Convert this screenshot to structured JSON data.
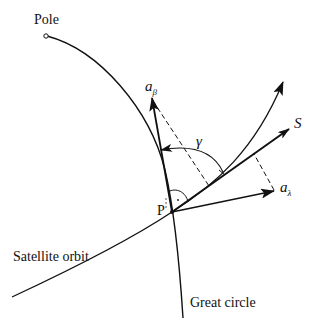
{
  "diagram": {
    "labels": {
      "pole": "Pole",
      "point": "P",
      "a_beta_main": "a",
      "a_beta_sub": "β",
      "a_lambda_main": "a",
      "a_lambda_sub": "λ",
      "s_vector": "S",
      "gamma": "γ",
      "satellite_orbit": "Satellite orbit",
      "great_circle": "Great circle"
    },
    "colors": {
      "stroke": "#111111",
      "background": "#ffffff"
    }
  }
}
